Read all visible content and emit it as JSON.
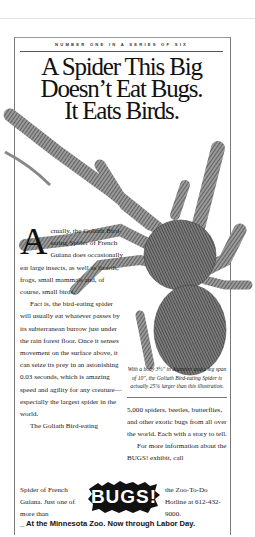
{
  "ad": {
    "series_label": "NUMBER ONE IN A SERIES OF SIX",
    "headline": [
      "A Spider This Big",
      "Doesn’t Eat Bugs.",
      "It Eats Birds."
    ],
    "illustration": "goliath-bird-eating-spider-illustration",
    "body_left": {
      "drop_cap": "A",
      "para1": "ctually, the Goliath Bird-eating Spider of French Guiana does occasionally eat large insects, as well as lizards, frogs, small mammals and, of course, small birds.",
      "para2": "Fact is, the bird-eating spider will usually eat whatever passes by its subterranean burrow just under the rain forest floor. Once it senses movement on the surface above, it can seize its prey in an astonishing 0.03 seconds, which is amazing speed and agility for any creature—especially the largest spider in the world.",
      "para3_start": "The Goliath Bird-eating",
      "para3_tail": "Spider of French Guiana. Just one of more than"
    },
    "caption": "With a body 3½\" in diameter and a leg span of 10\", the Goliath Bird-eating Spider is actually 25% larger than this illustration.",
    "body_right": {
      "para1": "5,000 spiders, beetles, butterflies, and other exotic bugs from all over the world. Each with a story to tell.",
      "para2_start": "For more information about the BUGS! exhibit, call",
      "contact": "the Zoo-To-Do Hotline at 612-432-9000."
    },
    "logo_text": "BUGS!",
    "tagline": "At the Minnesota Zoo. Now through Labor Day.",
    "colors": {
      "ink": "#111111",
      "paper": "#ffffff",
      "rule": "#777777"
    }
  }
}
